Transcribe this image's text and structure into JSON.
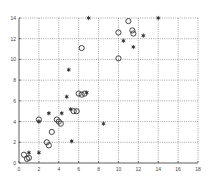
{
  "chart_data": {
    "type": "scatter",
    "title": "",
    "xlabel": "",
    "ylabel": "",
    "xlim": [
      0,
      18
    ],
    "ylim": [
      0,
      14
    ],
    "xticks": [
      0,
      2,
      4,
      6,
      8,
      10,
      12,
      14,
      16,
      18
    ],
    "yticks": [
      0,
      2,
      4,
      6,
      8,
      10,
      12,
      14
    ],
    "grid": true,
    "legend": null,
    "series": [
      {
        "name": "circles",
        "marker": "circle-open",
        "color": "#333333",
        "points": [
          [
            0.5,
            0.8
          ],
          [
            0.8,
            0.4
          ],
          [
            1.0,
            0.5
          ],
          [
            2.0,
            4.2
          ],
          [
            2.8,
            2.0
          ],
          [
            3.0,
            1.7
          ],
          [
            3.3,
            3.0
          ],
          [
            3.8,
            4.2
          ],
          [
            4.0,
            4.0
          ],
          [
            4.2,
            3.8
          ],
          [
            5.5,
            5.0
          ],
          [
            5.8,
            5.0
          ],
          [
            6.0,
            6.7
          ],
          [
            6.3,
            6.6
          ],
          [
            6.6,
            6.7
          ],
          [
            6.3,
            11.1
          ],
          [
            10.0,
            10.1
          ],
          [
            10.0,
            12.6
          ],
          [
            11.0,
            13.7
          ],
          [
            11.4,
            12.8
          ],
          [
            11.5,
            12.5
          ]
        ]
      },
      {
        "name": "stars",
        "marker": "asterisk",
        "color": "#333333",
        "points": [
          [
            1.0,
            1.0
          ],
          [
            2.0,
            1.0
          ],
          [
            2.0,
            4.0
          ],
          [
            3.0,
            4.8
          ],
          [
            4.3,
            4.8
          ],
          [
            4.8,
            6.4
          ],
          [
            5.2,
            5.2
          ],
          [
            5.3,
            2.1
          ],
          [
            5.0,
            9.0
          ],
          [
            6.8,
            6.8
          ],
          [
            7.0,
            14.0
          ],
          [
            8.5,
            3.8
          ],
          [
            10.5,
            11.8
          ],
          [
            11.5,
            11.2
          ],
          [
            12.5,
            12.3
          ],
          [
            14.0,
            14.0
          ]
        ]
      }
    ]
  },
  "axes": {
    "x_tick_labels": [
      "0",
      "2",
      "4",
      "6",
      "8",
      "10",
      "12",
      "14",
      "16",
      "18"
    ],
    "y_tick_labels": [
      "0",
      "2",
      "4",
      "6",
      "8",
      "10",
      "12",
      "14"
    ]
  }
}
